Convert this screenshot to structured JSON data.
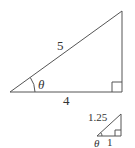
{
  "diagram": {
    "type": "right-triangle-similarity",
    "large_triangle": {
      "hypotenuse_label": "5",
      "base_label": "4",
      "angle_label": "θ",
      "right_angle_marker": true
    },
    "small_triangle": {
      "hypotenuse_label": "1.25",
      "base_label": "1",
      "angle_label": "θ",
      "right_angle_marker": true
    },
    "colors": {
      "line": "#555555",
      "text": "#333333",
      "background": "#ffffff"
    }
  }
}
